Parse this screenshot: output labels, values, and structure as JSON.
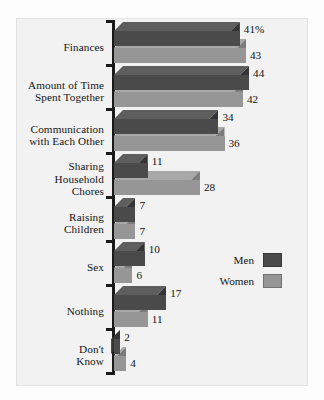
{
  "chart_data": {
    "type": "bar",
    "orientation": "horizontal",
    "style": "3d-grouped-horizontal-bar",
    "title": "",
    "xlabel": "",
    "ylabel": "",
    "xlim": [
      0,
      50
    ],
    "grid": false,
    "legend_position": "middle-right",
    "categories": [
      "Finances",
      "Amount of Time Spent Together",
      "Communication with Each Other",
      "Sharing Household Chores",
      "Raising Children",
      "Sex",
      "Nothing",
      "Don't Know"
    ],
    "category_lines": [
      [
        "Finances"
      ],
      [
        "Amount of Time",
        "Spent Together"
      ],
      [
        "Communication",
        "with Each Other"
      ],
      [
        "Sharing",
        "Household",
        "Chores"
      ],
      [
        "Raising",
        "Children"
      ],
      [
        "Sex"
      ],
      [
        "Nothing"
      ],
      [
        "Don't",
        "Know"
      ]
    ],
    "series": [
      {
        "name": "Men",
        "color": "#4a4a4a",
        "values": [
          41,
          44,
          34,
          11,
          7,
          10,
          17,
          2
        ]
      },
      {
        "name": "Women",
        "color": "#969696",
        "values": [
          43,
          42,
          36,
          28,
          7,
          6,
          11,
          4
        ]
      }
    ],
    "data_labels": [
      [
        "41%",
        "44",
        "34",
        "11",
        "7",
        "10",
        "17",
        "2"
      ],
      [
        "43",
        "42",
        "36",
        "28",
        "7",
        "6",
        "11",
        "4"
      ]
    ]
  },
  "legend": {
    "items": [
      {
        "label": "Men",
        "color": "#4a4a4a"
      },
      {
        "label": "Women",
        "color": "#969696"
      }
    ]
  },
  "colors": {
    "men_front": "#4a4a4a",
    "men_top": "#5e5e5e",
    "men_side": "#343434",
    "women_front": "#969696",
    "women_top": "#a8a8a8",
    "women_side": "#7c7c7c",
    "plot_background": "#f2f2f2",
    "axis": "#1a1a1a",
    "text": "#141414"
  },
  "caption": ""
}
